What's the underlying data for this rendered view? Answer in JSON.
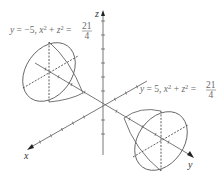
{
  "figure": {
    "type": "3d-surface-cross-sections",
    "axes": {
      "x_label": "x",
      "y_label": "y",
      "z_label": "z"
    },
    "annotations": [
      {
        "id": "left",
        "prefix": "y = −5, x",
        "sup1": "2",
        "mid": " + z",
        "sup2": "2",
        "eq": " = ",
        "numerator": "21",
        "denominator": "4"
      },
      {
        "id": "right",
        "prefix": "y = 5, x",
        "sup1": "2",
        "mid": " + z",
        "sup2": "2",
        "eq": " = ",
        "numerator": "21",
        "denominator": "4"
      }
    ],
    "colors": {
      "axis": "#555555",
      "curve": "#666666",
      "dashed": "#333333",
      "label": "#6a6a6a"
    }
  }
}
